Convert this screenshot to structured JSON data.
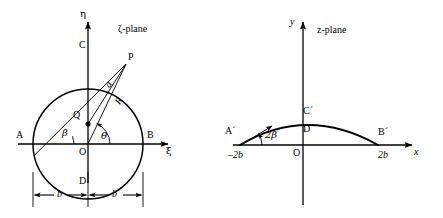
{
  "figure": {
    "background_color": "#ffffff",
    "stroke_color": "#000000",
    "width": 443,
    "height": 218
  },
  "left_panel": {
    "plane_label": "ζ-plane",
    "axes": {
      "vertical_label": "η",
      "horizontal_label": "ξ"
    },
    "points": [
      {
        "id": "A",
        "label": "A"
      },
      {
        "id": "B",
        "label": "B"
      },
      {
        "id": "C",
        "label": "C"
      },
      {
        "id": "D",
        "label": "D"
      },
      {
        "id": "O",
        "label": "O"
      },
      {
        "id": "P",
        "label": "P"
      },
      {
        "id": "Q",
        "label": "Q"
      }
    ],
    "annotations": [
      {
        "id": "radius-a",
        "label": "a"
      },
      {
        "id": "radius-R",
        "label": "R"
      },
      {
        "id": "angle-theta",
        "label": "θ"
      },
      {
        "id": "angle-beta",
        "label": "β"
      }
    ],
    "dimensions": [
      {
        "id": "half-width-left",
        "label": "b"
      },
      {
        "id": "half-width-right",
        "label": "b"
      }
    ]
  },
  "right_panel": {
    "plane_label": "z-plane",
    "axes": {
      "vertical_label": "y",
      "horizontal_label": "x"
    },
    "points": [
      {
        "id": "A-prime",
        "label": "A´"
      },
      {
        "id": "B-prime",
        "label": "B´"
      },
      {
        "id": "C-prime",
        "label": "C´"
      },
      {
        "id": "D-prime",
        "label": "D´"
      },
      {
        "id": "O",
        "label": "O"
      }
    ],
    "annotations": [
      {
        "id": "angle-two-beta",
        "label": "2β"
      }
    ],
    "tick_labels": [
      {
        "id": "x-min",
        "label": "–2b"
      },
      {
        "id": "x-max",
        "label": "2b"
      }
    ]
  }
}
